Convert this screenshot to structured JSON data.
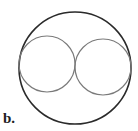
{
  "figure": {
    "label": "b.",
    "colors": {
      "outer_stroke": "#2a2a2a",
      "inner_stroke": "#7a7a7a",
      "background": "#ffffff"
    },
    "shapes": [
      {
        "name": "outer-circle",
        "role": "outer"
      },
      {
        "name": "inner-circle-left",
        "role": "inner"
      },
      {
        "name": "inner-circle-right",
        "role": "inner"
      }
    ]
  }
}
